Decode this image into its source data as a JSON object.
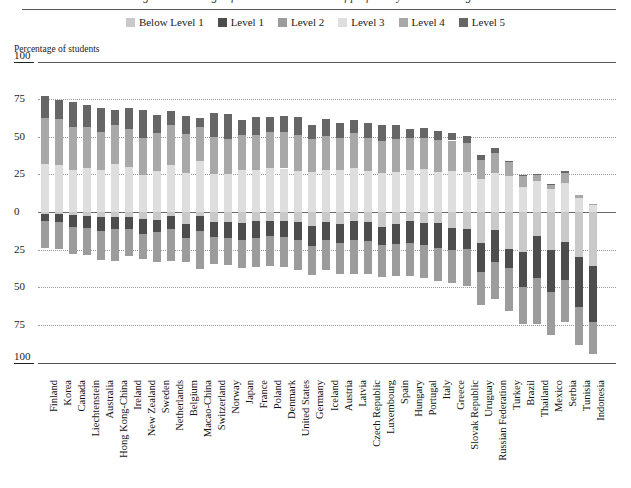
{
  "figure": {
    "title": "Figure: Percentage of students at each level of proficiency on the reading scale",
    "axis_caption": "Percentage of students"
  },
  "legend": {
    "position": "top-center",
    "items": [
      {
        "label": "Below Level 1",
        "color": "#c9c9c9",
        "key": "below1"
      },
      {
        "label": "Level 1",
        "color": "#4d4d4d",
        "key": "level1"
      },
      {
        "label": "Level 2",
        "color": "#9c9c9c",
        "key": "level2"
      },
      {
        "label": "Level 3",
        "color": "#dedede",
        "key": "level3"
      },
      {
        "label": "Level 4",
        "color": "#a8a8a8",
        "key": "level4"
      },
      {
        "label": "Level 5",
        "color": "#666666",
        "key": "level5"
      }
    ]
  },
  "yaxis": {
    "ticks_above": [
      "100",
      "75",
      "50",
      "25",
      "0"
    ],
    "ticks_below": [
      "25",
      "50",
      "75",
      "100"
    ],
    "all_ticks": [
      "100",
      "75",
      "50",
      "25",
      "0",
      "25",
      "50",
      "75",
      "100"
    ],
    "range_above": [
      0,
      100
    ],
    "range_below": [
      0,
      100
    ],
    "grid": true
  },
  "chart_data": {
    "type": "bar",
    "subtype": "diverging-stacked-bar",
    "title": "Percentage of students at each level of proficiency on the reading scale",
    "xlabel": "",
    "ylabel": "Percentage of students",
    "ylim": [
      -100,
      100
    ],
    "grid": true,
    "legend_position": "top-center",
    "series_above_zero": [
      "Level 3",
      "Level 4",
      "Level 5"
    ],
    "series_below_zero": [
      "Level 2",
      "Level 1",
      "Below Level 1"
    ],
    "categories": [
      "Finland",
      "Korea",
      "Canada",
      "Liechtenstein",
      "Australia",
      "Hong Kong-China",
      "Ireland",
      "New Zealand",
      "Sweden",
      "Netherlands",
      "Belgium",
      "Macao-China",
      "Switzerland",
      "Norway",
      "Japan",
      "France",
      "Poland",
      "Denmark",
      "United States",
      "Germany",
      "Iceland",
      "Austria",
      "Latvia",
      "Czech Republic",
      "Luxembourg",
      "Spain",
      "Hungary",
      "Portugal",
      "Italy",
      "Greece",
      "Slovak Republic",
      "Uruguay",
      "Russian Federation",
      "Turkey",
      "Brazil",
      "Thailand",
      "Mexico",
      "Serbia",
      "Tunisia",
      "Indonesia"
    ],
    "series": [
      {
        "name": "Below Level 1",
        "color": "#c9c9c9",
        "side": "below",
        "values": [
          1.1,
          1.4,
          2.2,
          2.6,
          3.6,
          3.0,
          3.3,
          4.8,
          5.4,
          2.4,
          7.8,
          2.5,
          6.5,
          6.4,
          7.4,
          6.3,
          5.9,
          5.9,
          6.4,
          9.3,
          6.8,
          8.2,
          6.0,
          6.7,
          10.1,
          8.1,
          6.3,
          7.3,
          7.4,
          10.6,
          11.2,
          20.6,
          12.2,
          24.8,
          26.6,
          16.0,
          25.3,
          20.1,
          30.2,
          35.8
        ]
      },
      {
        "name": "Level 1",
        "color": "#4d4d4d",
        "side": "below",
        "values": [
          4.6,
          5.4,
          7.5,
          8.0,
          8.9,
          8.2,
          7.8,
          9.7,
          7.9,
          9.0,
          9.3,
          10.1,
          10.1,
          11.0,
          11.5,
          11.1,
          10.2,
          10.9,
          12.3,
          13.3,
          11.7,
          12.4,
          12.9,
          12.8,
          11.9,
          13.1,
          14.4,
          14.4,
          16.5,
          14.5,
          13.6,
          19.4,
          21.1,
          12.7,
          23.0,
          28.0,
          27.8,
          25.2,
          32.6,
          37.6
        ]
      },
      {
        "name": "Level 2",
        "color": "#9c9c9c",
        "side": "below",
        "values": [
          18.1,
          18.0,
          18.0,
          18.0,
          19.3,
          21.2,
          18.2,
          16.6,
          19.7,
          21.4,
          16.3,
          25.0,
          18.1,
          17.5,
          18.2,
          18.9,
          19.9,
          19.6,
          19.6,
          19.4,
          20.3,
          20.7,
          22.0,
          21.5,
          21.0,
          21.1,
          22.0,
          22.1,
          21.8,
          22.2,
          24.1,
          22.0,
          24.3,
          28.0,
          24.8,
          30.4,
          28.9,
          27.7,
          25.8,
          20.9
        ]
      },
      {
        "name": "Level 3",
        "color": "#dedede",
        "side": "above",
        "values": [
          31.6,
          31.2,
          28.2,
          29.1,
          27.7,
          31.7,
          29.7,
          24.9,
          27.5,
          30.9,
          25.8,
          33.8,
          25.2,
          25.1,
          27.8,
          27.9,
          29.2,
          28.9,
          27.5,
          26.5,
          27.6,
          27.7,
          29.1,
          27.0,
          25.8,
          26.4,
          27.6,
          28.3,
          26.8,
          27.5,
          26.6,
          22.0,
          26.1,
          24.0,
          16.7,
          20.3,
          15.0,
          19.3,
          9.4,
          4.9
        ]
      },
      {
        "name": "Level 4",
        "color": "#a8a8a8",
        "side": "above",
        "values": [
          30.6,
          30.8,
          28.0,
          27.5,
          25.7,
          26.4,
          25.5,
          24.5,
          25.3,
          26.6,
          26.0,
          22.9,
          24.6,
          23.7,
          23.1,
          23.0,
          23.8,
          24.2,
          23.4,
          21.7,
          22.6,
          21.5,
          23.1,
          22.1,
          21.3,
          22.2,
          21.6,
          21.2,
          21.0,
          20.0,
          19.1,
          12.6,
          12.9,
          9.4,
          7.1,
          4.9,
          2.8,
          6.9,
          1.8,
          0.7
        ]
      },
      {
        "name": "Level 5",
        "color": "#666666",
        "side": "above",
        "values": [
          14.7,
          12.2,
          16.8,
          14.7,
          15.4,
          9.7,
          14.2,
          18.6,
          11.4,
          9.5,
          12.0,
          5.5,
          15.7,
          16.3,
          9.9,
          12.0,
          10.4,
          10.5,
          12.2,
          9.6,
          11.5,
          9.8,
          9.2,
          9.8,
          10.4,
          9.0,
          6.0,
          6.5,
          6.3,
          5.2,
          4.7,
          3.4,
          3.2,
          0.7,
          1.1,
          0.1,
          0.9,
          0.8,
          0.0,
          0.0
        ]
      }
    ]
  }
}
